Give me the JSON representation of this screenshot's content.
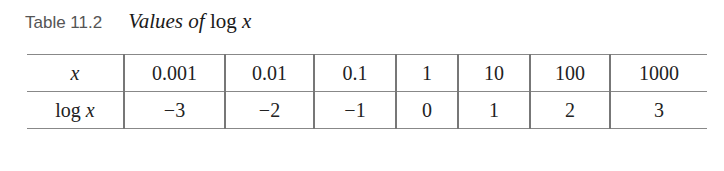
{
  "caption": {
    "label": "Table 11.2",
    "title_prefix": "Values of",
    "title_func": "log",
    "title_var": "x"
  },
  "table": {
    "rows": [
      {
        "header_func": "",
        "header_var": "x",
        "cells": [
          "0.001",
          "0.01",
          "0.1",
          "1",
          "10",
          "100",
          "1000"
        ]
      },
      {
        "header_func": "log ",
        "header_var": "x",
        "cells": [
          "−3",
          "−2",
          "−1",
          "0",
          "1",
          "2",
          "3"
        ]
      }
    ]
  }
}
